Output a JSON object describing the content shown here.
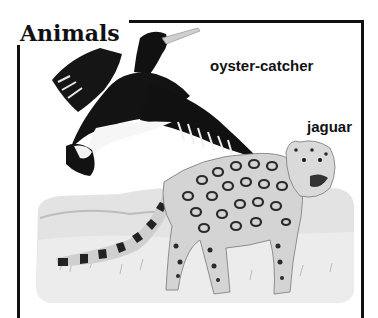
{
  "title": "Animals",
  "labels": {
    "bird": "oyster-catcher",
    "jaguar": "jaguar"
  },
  "illustrations": [
    {
      "name": "oyster-catcher",
      "description": "black-and-white bird in flight with long bill"
    },
    {
      "name": "jaguar",
      "description": "spotted jaguar standing in grassland landscape"
    }
  ],
  "colors": {
    "ink": "#111111",
    "background": "#ffffff",
    "landscape": "#d9d9d9"
  }
}
